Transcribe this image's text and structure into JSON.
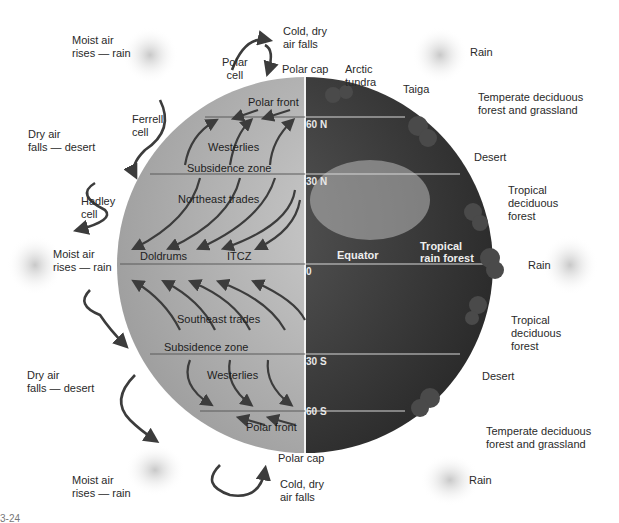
{
  "figure": {
    "type": "global-atmospheric-circulation-diagram",
    "fragment_label": "3-24"
  },
  "colors": {
    "background": "#ffffff",
    "left_globe": "#b8b8b8",
    "right_globe": "#3a3a3a",
    "arrows": "#3c3c3c",
    "lines": "#5a5a5a",
    "lat_text": "#e8e8e8"
  },
  "left_labels": {
    "moist_top": [
      "Moist air",
      "rises — rain"
    ],
    "dry_top": [
      "Dry air",
      "falls — desert"
    ],
    "moist_mid": [
      "Moist air",
      "rises — rain"
    ],
    "dry_bottom": [
      "Dry air",
      "falls — desert"
    ],
    "moist_bottom": [
      "Moist air",
      "rises — rain"
    ]
  },
  "cells": {
    "polar_top": [
      "Polar",
      "cell"
    ],
    "ferrell": [
      "Ferrell",
      "cell"
    ],
    "hadley": [
      "Hadley",
      "cell"
    ]
  },
  "top_labels": {
    "cold_dry": [
      "Cold, dry",
      "air falls"
    ],
    "polar_cap": "Polar cap",
    "arctic_tundra": [
      "Arctic",
      "tundra"
    ],
    "taiga": "Taiga"
  },
  "bottom_labels": {
    "polar_cap": "Polar cap",
    "cold_dry": [
      "Cold, dry",
      "air falls"
    ]
  },
  "globe_left_labels": {
    "polar_front_n": "Polar front",
    "westerlies_n": "Westerlies",
    "subsidence_n": "Subsidence zone",
    "ne_trades": "Northeast trades",
    "doldrums": "Doldrums",
    "itcz": "ITCZ",
    "se_trades": "Southeast trades",
    "subsidence_s": "Subsidence zone",
    "westerlies_s": "Westerlies",
    "polar_front_s": "Polar front"
  },
  "latitudes": {
    "n60": "60 N",
    "n30": "30 N",
    "eq": "0",
    "s30": "30 S",
    "s60": "60 S"
  },
  "globe_right_labels": {
    "equator": "Equator",
    "tropical_rf": [
      "Tropical",
      "rain forest"
    ]
  },
  "right_labels": {
    "rain_top": "Rain",
    "temperate_n": [
      "Temperate deciduous",
      "forest and grassland"
    ],
    "desert_n": "Desert",
    "tropical_dec_n": [
      "Tropical",
      "deciduous",
      "forest"
    ],
    "rain_mid": "Rain",
    "tropical_dec_s": [
      "Tropical",
      "deciduous",
      "forest"
    ],
    "desert_s": "Desert",
    "temperate_s": [
      "Temperate deciduous",
      "forest and grassland"
    ],
    "rain_bottom": "Rain"
  }
}
